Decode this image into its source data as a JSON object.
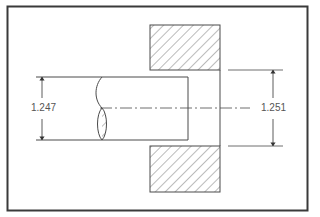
{
  "drawing": {
    "type": "engineering-fit-section",
    "colors": {
      "frame": "#3a3a3a",
      "line": "#4a4a4a",
      "hatch": "#555555",
      "text": "#555555",
      "background": "#ffffff"
    },
    "shaft": {
      "label": "shaft",
      "diameter_dimension": "1.247"
    },
    "bore": {
      "label": "hole",
      "diameter_dimension": "1.251"
    }
  }
}
